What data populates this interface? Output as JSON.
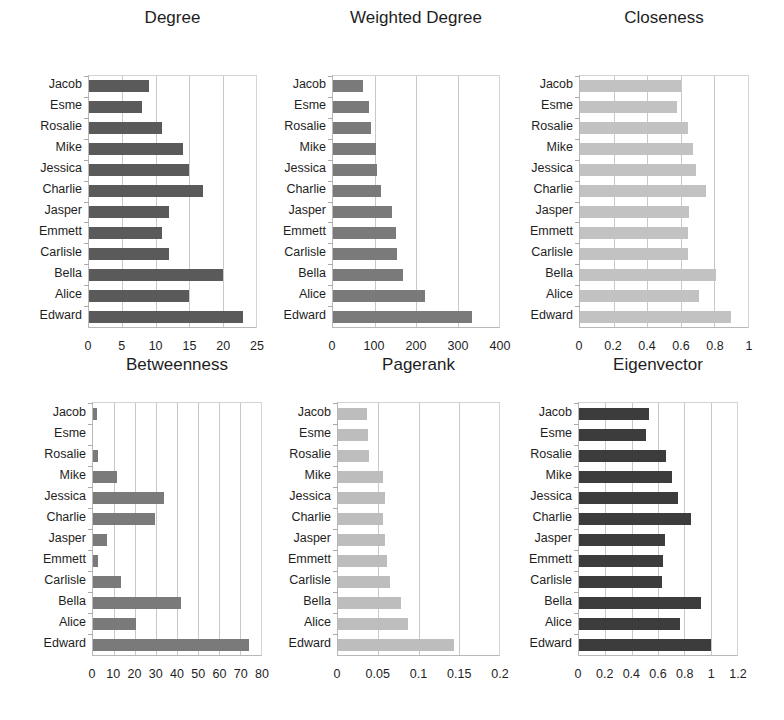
{
  "chart_data": [
    {
      "type": "bar",
      "orientation": "horizontal",
      "title": "Degree",
      "categories": [
        "Jacob",
        "Esme",
        "Rosalie",
        "Mike",
        "Jessica",
        "Charlie",
        "Jasper",
        "Emmett",
        "Carlisle",
        "Bella",
        "Alice",
        "Edward"
      ],
      "values": [
        9,
        8,
        11,
        14,
        15,
        17,
        12,
        11,
        12,
        20,
        15,
        23
      ],
      "xlim": [
        0,
        25
      ],
      "xticks": [
        "0",
        "5",
        "10",
        "15",
        "20",
        "25"
      ],
      "grid": true,
      "color": "#5a5a5a",
      "xlabel": "",
      "ylabel": ""
    },
    {
      "type": "bar",
      "orientation": "horizontal",
      "title": "Weighted Degree",
      "categories": [
        "Jacob",
        "Esme",
        "Rosalie",
        "Mike",
        "Jessica",
        "Charlie",
        "Jasper",
        "Emmett",
        "Carlisle",
        "Bella",
        "Alice",
        "Edward"
      ],
      "values": [
        73,
        86,
        91,
        103,
        105,
        115,
        143,
        151,
        154,
        168,
        221,
        336
      ],
      "xlim": [
        0,
        400
      ],
      "xticks": [
        "0",
        "100",
        "200",
        "300",
        "400"
      ],
      "grid": true,
      "color": "#7a7a7a",
      "xlabel": "",
      "ylabel": ""
    },
    {
      "type": "bar",
      "orientation": "horizontal",
      "title": "Closeness",
      "categories": [
        "Jacob",
        "Esme",
        "Rosalie",
        "Mike",
        "Jessica",
        "Charlie",
        "Jasper",
        "Emmett",
        "Carlisle",
        "Bella",
        "Alice",
        "Edward"
      ],
      "values": [
        0.6,
        0.58,
        0.64,
        0.67,
        0.69,
        0.75,
        0.65,
        0.64,
        0.64,
        0.81,
        0.71,
        0.9
      ],
      "xlim": [
        0,
        1
      ],
      "xticks": [
        "0",
        "0.2",
        "0.4",
        "0.6",
        "0.8",
        "1"
      ],
      "grid": true,
      "color": "#c2c2c2",
      "xlabel": "",
      "ylabel": ""
    },
    {
      "type": "bar",
      "orientation": "horizontal",
      "title": "Betweenness",
      "categories": [
        "Jacob",
        "Esme",
        "Rosalie",
        "Mike",
        "Jessica",
        "Charlie",
        "Jasper",
        "Emmett",
        "Carlisle",
        "Bella",
        "Alice",
        "Edward"
      ],
      "values": [
        2,
        0,
        2.5,
        11.6,
        33.7,
        29.3,
        6.7,
        2.3,
        13.3,
        42,
        20.5,
        74.4
      ],
      "xlim": [
        0,
        80
      ],
      "xticks": [
        "0",
        "10",
        "20",
        "30",
        "40",
        "50",
        "60",
        "70",
        "80"
      ],
      "grid": true,
      "color": "#7a7a7a",
      "xlabel": "",
      "ylabel": ""
    },
    {
      "type": "bar",
      "orientation": "horizontal",
      "title": "Pagerank",
      "categories": [
        "Jacob",
        "Esme",
        "Rosalie",
        "Mike",
        "Jessica",
        "Charlie",
        "Jasper",
        "Emmett",
        "Carlisle",
        "Bella",
        "Alice",
        "Edward"
      ],
      "values": [
        0.036,
        0.037,
        0.038,
        0.056,
        0.059,
        0.056,
        0.058,
        0.061,
        0.065,
        0.078,
        0.087,
        0.144
      ],
      "xlim": [
        0,
        0.2
      ],
      "xticks": [
        "0",
        "0.05",
        "0.1",
        "0.15",
        "0.2"
      ],
      "grid": true,
      "color": "#bdbdbd",
      "xlabel": "",
      "ylabel": ""
    },
    {
      "type": "bar",
      "orientation": "horizontal",
      "title": "Eigenvector",
      "categories": [
        "Jacob",
        "Esme",
        "Rosalie",
        "Mike",
        "Jessica",
        "Charlie",
        "Jasper",
        "Emmett",
        "Carlisle",
        "Bella",
        "Alice",
        "Edward"
      ],
      "values": [
        0.53,
        0.51,
        0.66,
        0.71,
        0.75,
        0.85,
        0.65,
        0.64,
        0.63,
        0.93,
        0.77,
        1.0
      ],
      "xlim": [
        0,
        1.2
      ],
      "xticks": [
        "0",
        "0.2",
        "0.4",
        "0.6",
        "0.8",
        "1",
        "1.2"
      ],
      "grid": true,
      "color": "#3c3c3c",
      "xlabel": "",
      "ylabel": ""
    }
  ]
}
